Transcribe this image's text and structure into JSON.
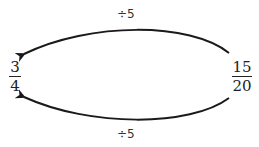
{
  "diagram": {
    "source_fraction": {
      "numerator": "15",
      "denominator": "20"
    },
    "target_fraction": {
      "numerator": "3",
      "denominator": "4"
    },
    "top_arrow_label": "÷5",
    "bottom_arrow_label": "÷5",
    "stroke_color": "#1a1a1a"
  }
}
